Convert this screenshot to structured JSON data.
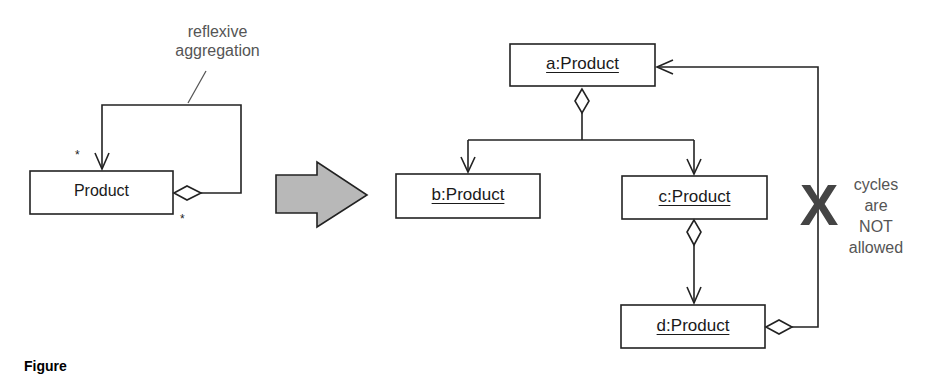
{
  "left_diagram": {
    "class_box": {
      "label": "Product"
    },
    "annotation": {
      "line1": "reflexive",
      "line2": "aggregation"
    },
    "multiplicity_target": "*",
    "multiplicity_source": "*"
  },
  "transform_arrow": {
    "fill": "#b8b8b8",
    "stroke": "#222222"
  },
  "right_diagram": {
    "objects": [
      {
        "id": "a",
        "label": "a:Product"
      },
      {
        "id": "b",
        "label": "b:Product"
      },
      {
        "id": "c",
        "label": "c:Product"
      },
      {
        "id": "d",
        "label": "d:Product"
      }
    ],
    "prohibition_mark": "X",
    "note": {
      "line1": "cycles",
      "line2": "are",
      "line3": "NOT",
      "line4": "allowed"
    }
  },
  "figure_caption": {
    "label": "Figure"
  },
  "colors": {
    "line": "#222222",
    "note_text": "#555555",
    "x_mark": "#444444"
  }
}
